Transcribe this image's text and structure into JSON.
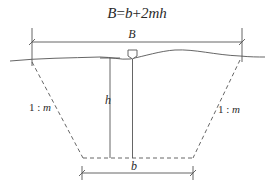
{
  "diagram": {
    "formula": {
      "lhs": "B",
      "eq": "=",
      "rhs_b": "b",
      "plus": "+",
      "rhs_term": "2mh"
    },
    "labels": {
      "top_width": "B",
      "bottom_width": "b",
      "depth": "h",
      "left_slope_one": "1",
      "left_slope_sep": " : ",
      "left_slope_m": "m",
      "right_slope_one": "1",
      "right_slope_sep": " : ",
      "right_slope_m": "m"
    },
    "colors": {
      "stroke": "#555555",
      "text": "#2a2a2a",
      "background": "#ffffff"
    }
  }
}
